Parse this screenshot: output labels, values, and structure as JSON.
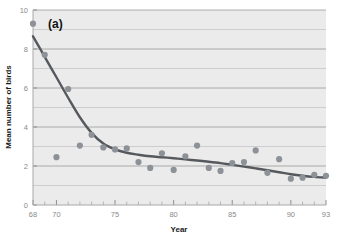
{
  "chart_data": {
    "type": "scatter",
    "title": "(a)",
    "panel_label": "(a)",
    "xlabel": "Year",
    "ylabel": "Mean number of birds",
    "xlim": [
      68,
      93
    ],
    "ylim": [
      0,
      10
    ],
    "grid": true,
    "grid_axis": "y",
    "legend": "none",
    "xticks_major": [
      68,
      70,
      75,
      80,
      85,
      90,
      93
    ],
    "xtick_labels": [
      "68",
      "70",
      "75",
      "80",
      "85",
      "90",
      "93"
    ],
    "xticks_minor_step": 1,
    "yticks": [
      0,
      2,
      4,
      6,
      8,
      10
    ],
    "ytick_labels": [
      "0",
      "2",
      "4",
      "6",
      "8",
      "10"
    ],
    "series": [
      {
        "name": "Mean number of birds",
        "marker": "circle",
        "color": "#8d9198",
        "x": [
          68,
          69,
          70,
          71,
          72,
          73,
          74,
          75,
          76,
          77,
          78,
          79,
          80,
          81,
          82,
          83,
          84,
          85,
          86,
          87,
          88,
          89,
          90,
          91,
          92,
          93
        ],
        "y": [
          9.3,
          7.7,
          2.45,
          5.95,
          3.05,
          3.6,
          2.95,
          2.85,
          2.9,
          2.2,
          1.9,
          2.65,
          1.8,
          2.5,
          3.05,
          1.9,
          1.75,
          2.15,
          2.2,
          2.8,
          1.65,
          2.35,
          1.35,
          1.4,
          1.55,
          1.5
        ]
      }
    ],
    "fit_curve": {
      "name": "fitted trend",
      "color": "#55595e",
      "x": [
        68,
        69,
        70,
        71,
        72,
        73,
        74,
        75,
        76,
        77,
        78,
        79,
        80,
        81,
        82,
        83,
        84,
        85,
        86,
        87,
        88,
        89,
        90,
        91,
        92,
        93
      ],
      "y": [
        8.65,
        7.6,
        6.55,
        5.5,
        4.5,
        3.7,
        3.15,
        2.85,
        2.68,
        2.58,
        2.5,
        2.45,
        2.4,
        2.34,
        2.28,
        2.22,
        2.15,
        2.06,
        1.97,
        1.88,
        1.78,
        1.68,
        1.58,
        1.5,
        1.44,
        1.4
      ]
    },
    "style": {
      "plot_background": "#ebebeb",
      "grid_color": "#9a9a9a",
      "axis_color": "#a8a8a8",
      "figure_background": "#ffffff"
    }
  }
}
